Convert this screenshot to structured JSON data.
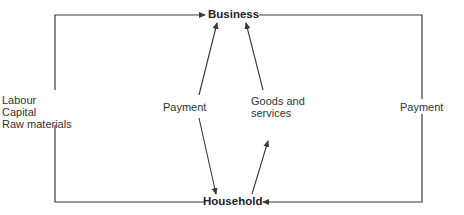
{
  "diagram": {
    "type": "circular-flow",
    "nodes": {
      "business": "Business",
      "household": "Household"
    },
    "labels": {
      "factors": [
        "Labour",
        "Capital",
        "Raw materials"
      ],
      "payment_inner": "Payment",
      "goods_services": [
        "Goods and",
        "services"
      ],
      "payment_outer": "Payment"
    },
    "edges": [
      {
        "from": "Household",
        "to": "Business",
        "label": "Labour, Capital, Raw materials",
        "route": "left-loop"
      },
      {
        "from": "Household",
        "to": "Business",
        "label": "Payment",
        "route": "inner-left"
      },
      {
        "from": "Business",
        "to": "Household",
        "label": "Payment",
        "route": "inner-left"
      },
      {
        "from": "Household",
        "to": "Business",
        "label": "Goods and services",
        "route": "inner-right"
      },
      {
        "from": "Business",
        "to": "Household",
        "label": "Goods and services",
        "route": "inner-right"
      },
      {
        "from": "Business",
        "to": "Household",
        "label": "Payment",
        "route": "right-loop"
      }
    ],
    "colors": {
      "line": "#3a3a3a",
      "text": "#2a2a2a",
      "background": "#ffffff"
    }
  }
}
